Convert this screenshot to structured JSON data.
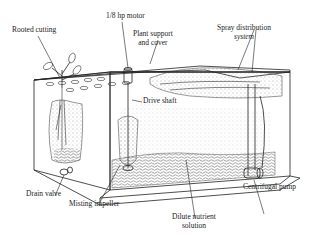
{
  "diagram": {
    "type": "aeroponic-propagation-unit",
    "labels": {
      "rooted_cutting": "Rooted cutting",
      "motor": "1/8 hp motor",
      "plant_support_l1": "Plant support",
      "plant_support_l2": "and cover",
      "spray_l1": "Spray distribution",
      "spray_l2": "system",
      "drive_shaft": "Drive shaft",
      "drain_valve": "Drain valve",
      "misting_impeller": "Misting impeller",
      "nutrient_l1": "Dilute nutrient",
      "nutrient_l2": "solution",
      "centrifugal_pump": "Centrifugal pump"
    },
    "colors": {
      "line": "#222222",
      "background": "#ffffff",
      "stipple": "#555555"
    }
  }
}
